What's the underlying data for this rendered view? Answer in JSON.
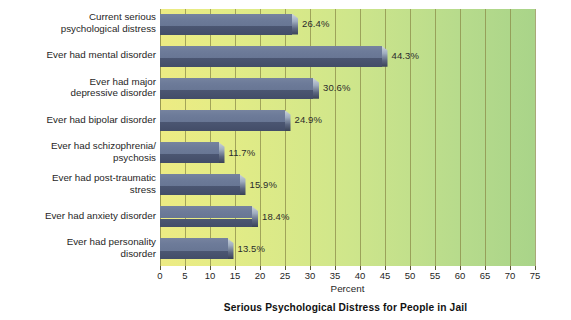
{
  "chart_data": {
    "type": "bar",
    "orientation": "horizontal",
    "title": "Serious Psychological Distress for People in Jail",
    "xlabel": "Percent",
    "ylabel": "",
    "xlim": [
      0,
      75
    ],
    "xticks": [
      0,
      5,
      10,
      15,
      20,
      25,
      30,
      35,
      40,
      45,
      50,
      55,
      60,
      65,
      70,
      75
    ],
    "grid": true,
    "legend": null,
    "categories": [
      "Current serious\npsychological distress",
      "Ever had mental disorder",
      "Ever had major\ndepressive disorder",
      "Ever had bipolar disorder",
      "Ever had schizophrenia/\npsychosis",
      "Ever had post-traumatic\nstress",
      "Ever had anxiety disorder",
      "Ever had personality\ndisorder"
    ],
    "values": [
      26.4,
      44.3,
      30.6,
      24.9,
      11.7,
      15.9,
      18.4,
      13.5
    ],
    "data_labels": [
      "26.4%",
      "44.3%",
      "30.6%",
      "24.9%",
      "11.7%",
      "15.9%",
      "18.4%",
      "13.5%"
    ]
  },
  "style": {
    "bar_face_light": "#6d7b99",
    "bar_face_dark": "#464f6b",
    "bar_highlight": "#cdd5dd",
    "plot_bg_left": "#edeb83",
    "plot_bg_right": "#a9d489",
    "gridline_color": "#8c8c4a",
    "text_color": "#1f1f1f",
    "page_bg": "#ffffff"
  }
}
